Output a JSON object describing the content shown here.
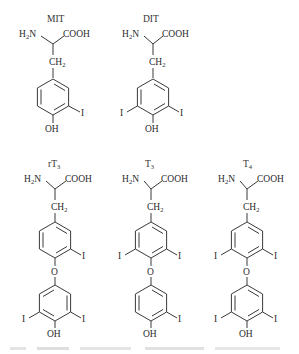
{
  "figure": {
    "type": "chemical-structures",
    "ink_color": "#2a2a2a",
    "background": "#ffffff",
    "molecules": [
      {
        "id": "mit",
        "name": "MIT",
        "amine": "H₂N",
        "acid": "COOH",
        "linker": "CH₂",
        "rings": [
          {
            "substituents": {
              "meta_right": "I",
              "para": "OH"
            }
          }
        ]
      },
      {
        "id": "dit",
        "name": "DIT",
        "amine": "H₂N",
        "acid": "COOH",
        "linker": "CH₂",
        "rings": [
          {
            "substituents": {
              "meta_left": "I",
              "meta_right": "I",
              "para": "OH"
            }
          }
        ]
      },
      {
        "id": "rt3",
        "name_main": "rT",
        "name_sub": "3",
        "amine": "H₂N",
        "acid": "COOH",
        "linker": "CH₂",
        "bridge": "O",
        "rings": [
          {
            "substituents": {
              "meta_right": "I"
            }
          },
          {
            "substituents": {
              "meta_left": "I",
              "meta_right": "I",
              "para": "OH"
            }
          }
        ]
      },
      {
        "id": "t3",
        "name_main": "T",
        "name_sub": "3",
        "amine": "H₂N",
        "acid": "COOH",
        "linker": "CH₂",
        "bridge": "O",
        "rings": [
          {
            "substituents": {
              "meta_left": "I",
              "meta_right": "I"
            }
          },
          {
            "substituents": {
              "meta_right": "I",
              "para": "OH"
            }
          }
        ]
      },
      {
        "id": "t4",
        "name_main": "T",
        "name_sub": "4",
        "amine": "H₂N",
        "acid": "COOH",
        "linker": "CH₂",
        "bridge": "O",
        "rings": [
          {
            "substituents": {
              "meta_left": "I",
              "meta_right": "I"
            }
          },
          {
            "substituents": {
              "meta_left": "I",
              "meta_right": "I",
              "para": "OH"
            }
          }
        ]
      }
    ],
    "iodine": "I",
    "hydroxyl": "OH",
    "amine_main": "H",
    "amine_sub": "2",
    "amine_tail": "N",
    "ch_main": "CH",
    "ch_sub": "2"
  }
}
